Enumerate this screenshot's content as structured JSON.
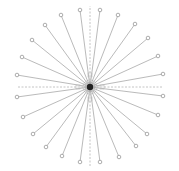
{
  "diagram": {
    "type": "radial-star-graph",
    "width": 179,
    "height": 171,
    "center": {
      "x": 90,
      "y": 87,
      "radius": 3.2,
      "color": "#222222",
      "halo_color": "#9a9a9a"
    },
    "colors": {
      "spoke": "#a8a8a8",
      "axis_dash": "#b5b5b5",
      "node_stroke": "#8a8a8a",
      "node_fill": "#ffffff",
      "background": "#ffffff"
    },
    "axes": [
      {
        "name": "axis-top",
        "x2": 90,
        "y2": 6
      },
      {
        "name": "axis-bottom",
        "x2": 90,
        "y2": 166
      },
      {
        "name": "axis-left",
        "x2": 18,
        "y2": 87
      },
      {
        "name": "axis-right",
        "x2": 163,
        "y2": 87
      }
    ],
    "axis_markers": [
      {
        "x": 90,
        "y": 75
      },
      {
        "x": 90,
        "y": 99
      },
      {
        "x": 78,
        "y": 87
      },
      {
        "x": 102,
        "y": 87
      }
    ],
    "leaf_nodes": [
      {
        "id": 1,
        "x": 80,
        "y": 10
      },
      {
        "id": 2,
        "x": 100,
        "y": 10
      },
      {
        "id": 3,
        "x": 61,
        "y": 15
      },
      {
        "id": 4,
        "x": 118,
        "y": 15
      },
      {
        "id": 5,
        "x": 45,
        "y": 25
      },
      {
        "id": 6,
        "x": 135,
        "y": 24
      },
      {
        "id": 7,
        "x": 32,
        "y": 40
      },
      {
        "id": 8,
        "x": 148,
        "y": 38
      },
      {
        "id": 9,
        "x": 22,
        "y": 57
      },
      {
        "id": 10,
        "x": 158,
        "y": 56
      },
      {
        "id": 11,
        "x": 17,
        "y": 75
      },
      {
        "id": 12,
        "x": 163,
        "y": 74
      },
      {
        "id": 13,
        "x": 17,
        "y": 97
      },
      {
        "id": 14,
        "x": 163,
        "y": 96
      },
      {
        "id": 15,
        "x": 23,
        "y": 117
      },
      {
        "id": 16,
        "x": 158,
        "y": 115
      },
      {
        "id": 17,
        "x": 33,
        "y": 134
      },
      {
        "id": 18,
        "x": 147,
        "y": 134
      },
      {
        "id": 19,
        "x": 46,
        "y": 147
      },
      {
        "id": 20,
        "x": 136,
        "y": 146
      },
      {
        "id": 21,
        "x": 62,
        "y": 156
      },
      {
        "id": 22,
        "x": 119,
        "y": 157
      },
      {
        "id": 23,
        "x": 80,
        "y": 162
      },
      {
        "id": 24,
        "x": 100,
        "y": 162
      }
    ],
    "leaf_count": 24,
    "node_radius": 1.8
  }
}
